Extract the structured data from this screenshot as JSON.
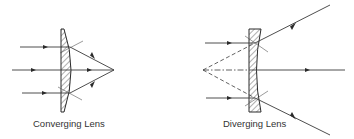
{
  "diagram": {
    "lenses": [
      {
        "id": "converging",
        "label": "Converging Lens",
        "type": "plano-convex",
        "incoming_rays": 3,
        "behavior": "parallel rays converge to a real focal point"
      },
      {
        "id": "diverging",
        "label": "Diverging Lens",
        "type": "plano-concave",
        "incoming_rays": 3,
        "behavior": "parallel rays diverge from a virtual focal point"
      }
    ],
    "colors": {
      "line": "#3a3a3a",
      "text": "#333333",
      "background": "#ffffff"
    }
  }
}
